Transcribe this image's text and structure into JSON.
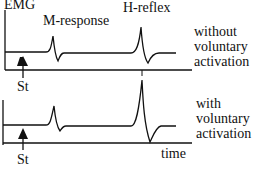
{
  "labels": {
    "y_axis": "EMG",
    "m_response": "M-response",
    "h_reflex": "H-reflex",
    "stimulus_top": "St",
    "stimulus_bottom": "St",
    "x_axis": "time"
  },
  "conditions": [
    {
      "line1": "without",
      "line2": "voluntary",
      "line3": "activation"
    },
    {
      "line1": "with",
      "line2": "voluntary",
      "line3": "activation"
    }
  ],
  "colors": {
    "stroke": "#111111",
    "background": "#ffffff"
  }
}
